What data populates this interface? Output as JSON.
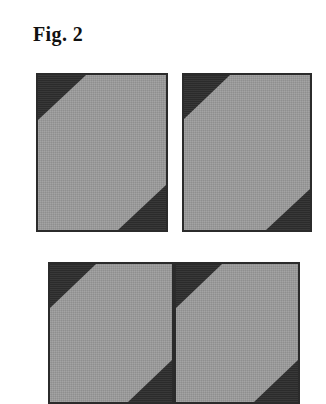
{
  "figure": {
    "label": "Fig. 2",
    "background_color": "#ffffff",
    "panel_fill_color": "#9b9b9b",
    "panel_wedge_color": "#2d2d2d",
    "panel_border_color": "#2b2b2b",
    "panel_count": 4,
    "row_count": 2,
    "panels": [
      {
        "id": "panel-top-left",
        "row": 1,
        "column": 1,
        "x": 36,
        "y": 73,
        "width": 132,
        "height": 159,
        "wedge_top_left": {
          "width": 48,
          "height": 45
        },
        "wedge_bottom_right": {
          "width": 48,
          "height": 45
        },
        "cropped": false
      },
      {
        "id": "panel-top-right",
        "row": 1,
        "column": 2,
        "x": 182,
        "y": 73,
        "width": 130,
        "height": 159,
        "wedge_top_left": {
          "width": 46,
          "height": 44
        },
        "wedge_bottom_right": {
          "width": 44,
          "height": 41
        },
        "cropped": false
      },
      {
        "id": "panel-bottom-left",
        "row": 2,
        "column": 1,
        "x": 48,
        "y": 262,
        "width": 126,
        "height": 142,
        "wedge_top_left": {
          "width": 46,
          "height": 44
        },
        "wedge_bottom_right": {
          "width": 44,
          "height": 42
        },
        "cropped": true
      },
      {
        "id": "panel-bottom-right",
        "row": 2,
        "column": 2,
        "x": 174,
        "y": 262,
        "width": 126,
        "height": 142,
        "wedge_top_left": {
          "width": 46,
          "height": 44
        },
        "wedge_bottom_right": {
          "width": 44,
          "height": 42
        },
        "cropped": true
      }
    ]
  }
}
